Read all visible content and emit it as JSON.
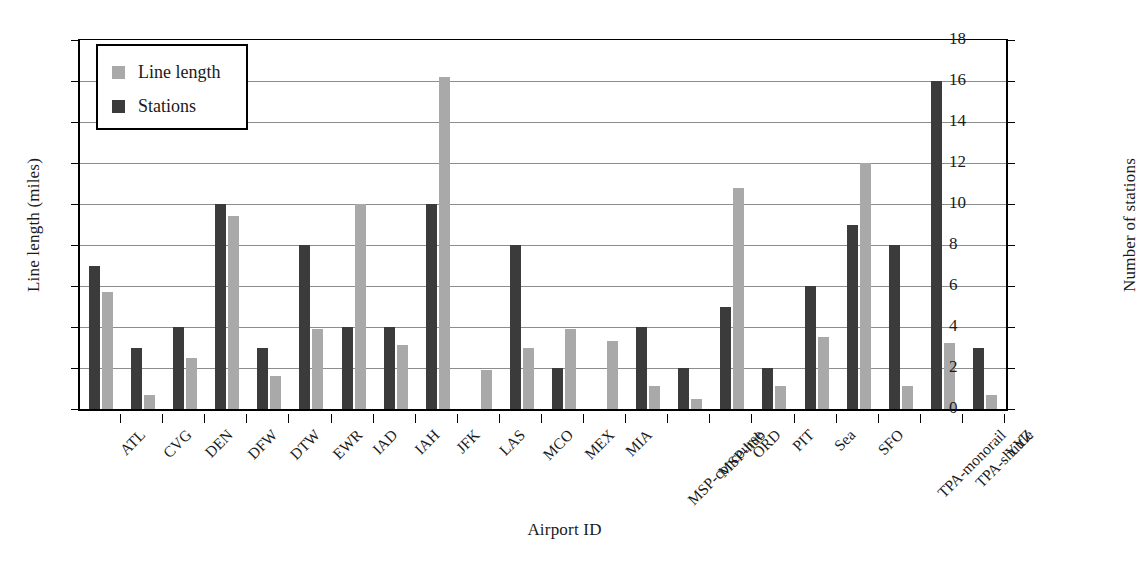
{
  "chart_data": {
    "type": "bar",
    "title": "",
    "xlabel": "Airport ID",
    "ylabel": "Line length (miles)",
    "ylabel_secondary": "Number of stations",
    "ylim": [
      0,
      9
    ],
    "ylim_secondary": [
      0,
      18
    ],
    "yticks": [
      "0",
      "1",
      "2",
      "3",
      "4",
      "5",
      "6",
      "7",
      "8",
      "9"
    ],
    "yticks_secondary": [
      "0",
      "2",
      "4",
      "6",
      "8",
      "10",
      "12",
      "14",
      "16",
      "18"
    ],
    "grid": true,
    "legend_position": "top-left",
    "categories": [
      "ATL",
      "CVG",
      "DEN",
      "DFW",
      "DTW",
      "EWR",
      "IAD",
      "IAH",
      "JFK",
      "LAS",
      "MCO",
      "MEX",
      "MIA",
      "MSP-concourse",
      "MSP-hub",
      "ORD",
      "PIT",
      "Sea",
      "SFO",
      "TPA-monorail",
      "TPA-shuttle",
      "YYZ"
    ],
    "series": [
      {
        "name": "Line length",
        "axis": "left",
        "unit": "miles",
        "color": "#a9a9a9",
        "values": [
          2.85,
          0.35,
          1.25,
          4.7,
          0.8,
          1.95,
          5.0,
          1.55,
          8.1,
          0.95,
          1.5,
          1.95,
          1.65,
          0.55,
          0.25,
          5.4,
          0.55,
          1.75,
          6.0,
          0.55,
          1.6,
          0.35
        ]
      },
      {
        "name": "Stations",
        "axis": "right",
        "unit": "stations",
        "color": "#3b3b3b",
        "values": [
          7,
          3,
          4,
          10,
          3,
          8,
          4,
          4,
          10,
          0,
          8,
          2,
          0,
          4,
          2,
          5,
          2,
          6,
          9,
          8,
          16,
          3
        ]
      }
    ]
  },
  "legend": {
    "items": [
      {
        "label": "Line length",
        "swatch": "linelength"
      },
      {
        "label": "Stations",
        "swatch": "stations"
      }
    ]
  }
}
